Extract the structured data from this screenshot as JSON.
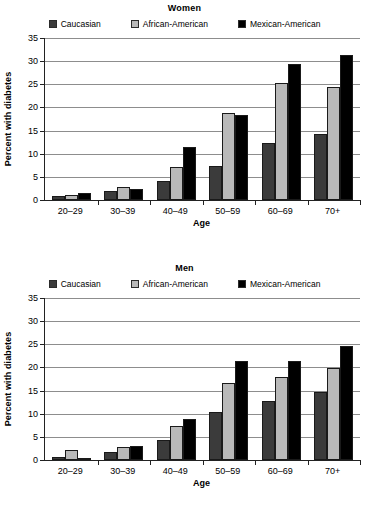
{
  "chart_data": [
    {
      "type": "bar",
      "title": "Women",
      "xlabel": "Age",
      "ylabel": "Percent with diabetes",
      "ylim": [
        0,
        35
      ],
      "yticks": [
        0,
        5,
        10,
        15,
        20,
        25,
        30,
        35
      ],
      "grid": true,
      "legend_position": "top",
      "categories": [
        "20–29",
        "30–39",
        "40–49",
        "50–59",
        "60–69",
        "70+"
      ],
      "series": [
        {
          "name": "Caucasian",
          "color": "#3b3b3b",
          "values": [
            0.8,
            2.0,
            4.2,
            7.3,
            12.4,
            14.2
          ]
        },
        {
          "name": "African-American",
          "color": "#b9b9b9",
          "values": [
            1.1,
            2.9,
            7.2,
            18.9,
            25.2,
            24.5
          ]
        },
        {
          "name": "Mexican-American",
          "color": "#000000",
          "values": [
            1.5,
            2.4,
            11.5,
            18.4,
            29.4,
            31.3
          ]
        }
      ]
    },
    {
      "type": "bar",
      "title": "Men",
      "xlabel": "Age",
      "ylabel": "Percent with diabetes",
      "ylim": [
        0,
        35
      ],
      "yticks": [
        0,
        5,
        10,
        15,
        20,
        25,
        30,
        35
      ],
      "grid": true,
      "legend_position": "top",
      "categories": [
        "20–29",
        "30–39",
        "40–49",
        "50–59",
        "60–69",
        "70+"
      ],
      "series": [
        {
          "name": "Caucasian",
          "color": "#3b3b3b",
          "values": [
            0.7,
            1.8,
            4.4,
            10.4,
            12.8,
            14.6
          ]
        },
        {
          "name": "African-American",
          "color": "#b9b9b9",
          "values": [
            2.2,
            2.8,
            7.3,
            16.7,
            18.0,
            19.8
          ]
        },
        {
          "name": "Mexican-American",
          "color": "#000000",
          "values": [
            0.4,
            3.1,
            8.8,
            21.3,
            21.3,
            24.7
          ]
        }
      ]
    }
  ]
}
